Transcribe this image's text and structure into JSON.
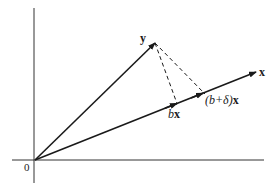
{
  "diagram": {
    "title": "",
    "colors": {
      "line": "#1a1a1a",
      "axis": "#333333",
      "background": "#ffffff"
    },
    "labels": {
      "origin": "0",
      "y_vector": "y",
      "x_vector": "x",
      "bx_coef": "b",
      "bx_vec": "x",
      "bdx_coef": "(b+δ)",
      "bdx_vec": "x"
    },
    "points": {
      "origin": [
        35,
        160
      ],
      "y_tip": [
        155,
        43
      ],
      "x_tip": [
        256,
        72
      ],
      "bx": [
        177,
        104
      ],
      "b_plus_delta_x": [
        203,
        96
      ]
    },
    "elements": [
      "vertical axis",
      "horizontal axis",
      "vector y from origin",
      "vector x from origin",
      "arrow marking bx on x",
      "arrow marking (b+δ)x on x",
      "dashed line y to bx",
      "dashed line y to (b+δ)x"
    ]
  }
}
